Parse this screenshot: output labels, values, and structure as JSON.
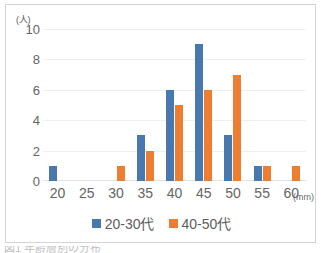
{
  "chart_data": {
    "type": "bar",
    "title": "",
    "subtitle": "",
    "xlabel": "(mm)",
    "ylabel": "(人)",
    "categories": [
      "20",
      "25",
      "30",
      "35",
      "40",
      "45",
      "50",
      "55",
      "60"
    ],
    "series": [
      {
        "name": "20-30代",
        "color": "#4878ae",
        "values": [
          1,
          0,
          0,
          3,
          6,
          9,
          3,
          1,
          0
        ]
      },
      {
        "name": "40-50代",
        "color": "#ed7d31",
        "values": [
          0,
          0,
          1,
          2,
          5,
          6,
          7,
          1,
          1
        ]
      }
    ],
    "ylim": [
      0,
      10
    ],
    "yticks": [
      0,
      2,
      4,
      6,
      8,
      10
    ],
    "grid": true,
    "legend_position": "bottom"
  },
  "axes": {
    "y_unit_label": "(人)",
    "x_unit_label": "(mm)",
    "y_tick_labels": [
      "10",
      "8",
      "6",
      "4",
      "2",
      "0"
    ],
    "x_tick_labels": [
      "20",
      "25",
      "30",
      "35",
      "40",
      "45",
      "50",
      "55",
      "60"
    ]
  },
  "legend": {
    "items": [
      {
        "label": "20-30代",
        "color": "#4878ae"
      },
      {
        "label": "40-50代",
        "color": "#ed7d31"
      }
    ]
  },
  "footer": {
    "cut_off_caption": "図1 年齢層別の分布"
  },
  "colors": {
    "series_blue": "#4878ae",
    "series_orange": "#ed7d31",
    "gridline": "#efefef",
    "frame_border": "#d4d4d4",
    "tick_text": "#646464"
  }
}
